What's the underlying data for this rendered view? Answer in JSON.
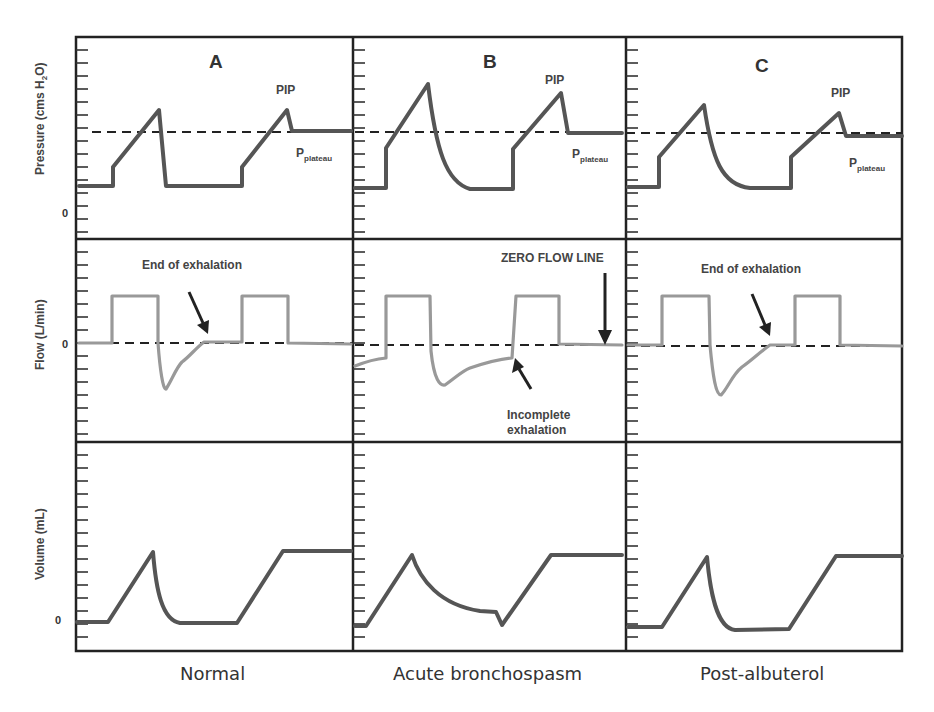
{
  "chart_data": {
    "type": "line",
    "columns": [
      {
        "letter": "A",
        "caption": "Normal"
      },
      {
        "letter": "B",
        "caption": "Acute bronchospasm"
      },
      {
        "letter": "C",
        "caption": "Post-albuterol"
      }
    ],
    "rows": [
      {
        "ylabel": "Pressure (cms H2O)",
        "zero_label": "0"
      },
      {
        "ylabel": "Flow (L/min)",
        "zero_label": "0"
      },
      {
        "ylabel": "Volume (mL)",
        "zero_label": "0"
      }
    ],
    "grid": false,
    "annotations": {
      "pip": "PIP",
      "pplateau_main": "P",
      "pplateau_sub": "plateau",
      "end_exhalation": "End of exhalation",
      "zero_flow_line": "ZERO FLOW LINE",
      "incomplete_1": "Incomplete",
      "incomplete_2": "exhalation"
    },
    "series_notes": [
      {
        "panel": "A-pressure",
        "description": "Baseline, step up, linear rise to PIP, rapid drop to baseline; second breath rises to PIP then falls to plateau (dashed)"
      },
      {
        "panel": "B-pressure",
        "description": "Higher PIP, slow exponential decay back to baseline (bronchospasm)"
      },
      {
        "panel": "C-pressure",
        "description": "Reduced PIP vs B, faster decay"
      },
      {
        "panel": "A-flow",
        "description": "Square inspiratory flow; expiratory flow returns to zero before next breath"
      },
      {
        "panel": "B-flow",
        "description": "Expiratory flow does not return to zero before next breath (incomplete exhalation / auto-PEEP)"
      },
      {
        "panel": "C-flow",
        "description": "Expiratory flow returns to zero"
      },
      {
        "panel": "A-volume",
        "description": "Volume returns to zero baseline"
      },
      {
        "panel": "B-volume",
        "description": "Volume fails to return to zero before next breath"
      },
      {
        "panel": "C-volume",
        "description": "Volume returns to baseline"
      }
    ]
  }
}
